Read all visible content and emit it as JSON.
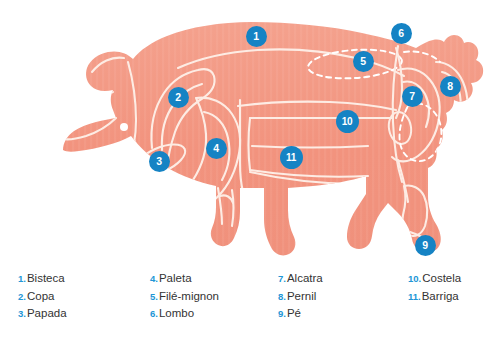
{
  "diagram": {
    "colors": {
      "body_fill": "#f2937e",
      "body_fill_light": "#f4a08d",
      "cut_line": "#fdece4",
      "marker_blue": "#1583c4",
      "legend_number_blue": "#2196d6",
      "legend_text": "#333333",
      "background": "#ffffff"
    },
    "markers": [
      {
        "id": "1",
        "number": "1",
        "label": "Bisteca",
        "x": 256,
        "y": 36
      },
      {
        "id": "2",
        "number": "2",
        "label": "Copa",
        "x": 178,
        "y": 97
      },
      {
        "id": "3",
        "number": "3",
        "label": "Papada",
        "x": 159,
        "y": 161
      },
      {
        "id": "4",
        "number": "4",
        "label": "Paleta",
        "x": 216,
        "y": 148
      },
      {
        "id": "5",
        "number": "5",
        "label": "Filé-mignon",
        "x": 363,
        "y": 61
      },
      {
        "id": "6",
        "number": "6",
        "label": "Lombo",
        "x": 401,
        "y": 33
      },
      {
        "id": "7",
        "number": "7",
        "label": "Alcatra",
        "x": 412,
        "y": 96
      },
      {
        "id": "8",
        "number": "8",
        "label": "Pernil",
        "x": 450,
        "y": 86
      },
      {
        "id": "9",
        "number": "9",
        "label": "Pé",
        "x": 425,
        "y": 245
      },
      {
        "id": "10",
        "number": "10",
        "label": "Costela",
        "x": 347,
        "y": 121
      },
      {
        "id": "11",
        "number": "11",
        "label": "Barriga",
        "x": 291,
        "y": 157
      }
    ]
  },
  "legend": {
    "columns": [
      {
        "id": "column-1",
        "x": 18,
        "items": [
          {
            "number": "1.",
            "label": "Bisteca"
          },
          {
            "number": "2.",
            "label": "Copa"
          },
          {
            "number": "3.",
            "label": "Papada"
          }
        ]
      },
      {
        "id": "column-2",
        "x": 150,
        "items": [
          {
            "number": "4.",
            "label": "Paleta"
          },
          {
            "number": "5.",
            "label": "Filé-mignon"
          },
          {
            "number": "6.",
            "label": "Lombo"
          }
        ]
      },
      {
        "id": "column-3",
        "x": 278,
        "items": [
          {
            "number": "7.",
            "label": "Alcatra"
          },
          {
            "number": "8.",
            "label": "Pernil"
          },
          {
            "number": "9.",
            "label": "Pé"
          }
        ]
      },
      {
        "id": "column-4",
        "x": 408,
        "items": [
          {
            "number": "10.",
            "label": "Costela"
          },
          {
            "number": "11.",
            "label": "Barriga"
          }
        ]
      }
    ]
  }
}
